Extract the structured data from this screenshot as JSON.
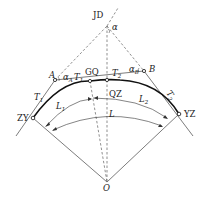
{
  "diagram": {
    "type": "compound curve geometry (circular curve with intermediate point)",
    "points": {
      "JD": "JD",
      "A": "A",
      "B": "B",
      "GQ": "GQ",
      "QZ": "QZ",
      "ZY": "ZY",
      "YZ": "YZ",
      "O": "O"
    },
    "labels": {
      "alpha": "α",
      "alpha_A": "α",
      "alpha_A_sub": "A",
      "alpha_B": "α",
      "alpha_B_sub": "B",
      "T1_left": "T",
      "T1_left_sub": "1",
      "T1_mid": "T",
      "T1_mid_sub": "1",
      "T2_mid": "T",
      "T2_mid_sub": "2",
      "T2_right": "T",
      "T2_right_sub": "2",
      "L1": "L",
      "L1_sub": "1",
      "L2": "L",
      "L2_sub": "2",
      "L": "L"
    }
  }
}
